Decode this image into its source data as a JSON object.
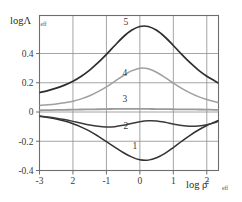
{
  "chart_data": {
    "type": "line",
    "title": "",
    "xlabel": "log ρ̄",
    "xlabel_sub": "eff",
    "ylabel": "logΛ",
    "ylabel_sub": "eff",
    "xlim": [
      -3,
      2.35
    ],
    "ylim": [
      -0.4,
      0.66
    ],
    "xticks": [
      -3,
      -2,
      -1,
      0,
      1,
      2
    ],
    "xticklabels": [
      "-3",
      "2",
      "-1",
      "0",
      "1",
      "2"
    ],
    "yticks": [
      0.4,
      0.2,
      0,
      -0.2,
      -0.4
    ],
    "yticklabels": [
      "0.4",
      "0.2",
      "0",
      "-0.2",
      "-0.4"
    ],
    "grid": true,
    "legend_position": "inline-labels",
    "x": [
      -3.0,
      -2.75,
      -2.5,
      -2.25,
      -2.0,
      -1.75,
      -1.5,
      -1.25,
      -1.0,
      -0.75,
      -0.5,
      -0.25,
      0.0,
      0.25,
      0.5,
      0.75,
      1.0,
      1.25,
      1.5,
      1.75,
      2.0,
      2.25,
      2.35
    ],
    "series": [
      {
        "name": "1",
        "label": "1",
        "color": "#333333",
        "width": 1.5,
        "label_x": -0.15,
        "label_y": -0.255,
        "values": [
          -0.03,
          -0.038,
          -0.048,
          -0.062,
          -0.08,
          -0.103,
          -0.131,
          -0.165,
          -0.202,
          -0.24,
          -0.277,
          -0.307,
          -0.327,
          -0.329,
          -0.313,
          -0.283,
          -0.243,
          -0.2,
          -0.159,
          -0.123,
          -0.092,
          -0.068,
          -0.058
        ]
      },
      {
        "name": "2",
        "label": "2",
        "color": "#3a3a3a",
        "width": 1.5,
        "label_x": -0.42,
        "label_y": -0.118,
        "values": [
          -0.028,
          -0.034,
          -0.042,
          -0.052,
          -0.064,
          -0.077,
          -0.089,
          -0.098,
          -0.102,
          -0.1,
          -0.091,
          -0.078,
          -0.066,
          -0.06,
          -0.061,
          -0.07,
          -0.082,
          -0.092,
          -0.097,
          -0.095,
          -0.087,
          -0.072,
          -0.062
        ]
      },
      {
        "name": "3",
        "label": "3",
        "color": "#9a9a9a",
        "width": 1.8,
        "label_x": -0.45,
        "label_y": 0.068,
        "values": [
          0.012,
          0.013,
          0.014,
          0.015,
          0.016,
          0.017,
          0.018,
          0.019,
          0.02,
          0.021,
          0.021,
          0.021,
          0.021,
          0.021,
          0.02,
          0.02,
          0.019,
          0.018,
          0.018,
          0.017,
          0.016,
          0.015,
          0.015
        ]
      },
      {
        "name": "4",
        "label": "4",
        "color": "#9f9f9f",
        "width": 1.5,
        "label_x": -0.45,
        "label_y": 0.245,
        "values": [
          0.045,
          0.049,
          0.055,
          0.063,
          0.074,
          0.09,
          0.111,
          0.139,
          0.172,
          0.21,
          0.248,
          0.281,
          0.3,
          0.296,
          0.272,
          0.237,
          0.198,
          0.162,
          0.131,
          0.105,
          0.085,
          0.07,
          0.064
        ]
      },
      {
        "name": "5",
        "label": "5",
        "color": "#2e2e2e",
        "width": 1.7,
        "label_x": -0.42,
        "label_y": 0.598,
        "values": [
          0.133,
          0.146,
          0.163,
          0.184,
          0.211,
          0.245,
          0.287,
          0.337,
          0.394,
          0.455,
          0.513,
          0.559,
          0.585,
          0.585,
          0.559,
          0.513,
          0.455,
          0.394,
          0.337,
          0.287,
          0.245,
          0.211,
          0.197
        ]
      }
    ]
  },
  "figure": {
    "frame_color": "#6e6e6e",
    "grid_color": "#8d8d8d",
    "background": "#ffffff"
  }
}
